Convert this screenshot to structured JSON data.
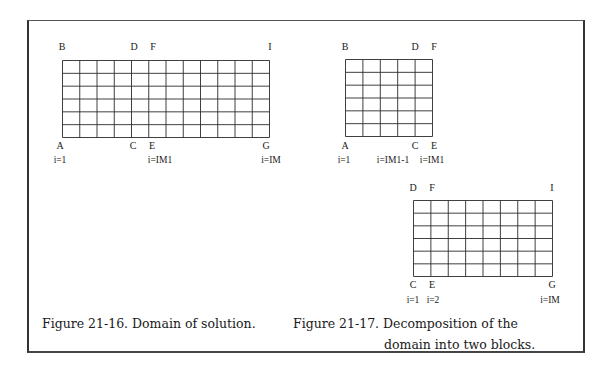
{
  "figures": [
    {
      "id": "fig-21-16",
      "caption": "Figure 21-16. Domain of solution.",
      "grid": {
        "x": 62,
        "y": 60,
        "width": 207,
        "height": 77,
        "columns": 12,
        "rows": 6
      },
      "corner_labels": [
        {
          "text": "B",
          "x": 62,
          "y": 42
        },
        {
          "text": "D",
          "x": 134,
          "y": 42
        },
        {
          "text": "F",
          "x": 153,
          "y": 42
        },
        {
          "text": "I",
          "x": 270,
          "y": 42
        },
        {
          "text": "A",
          "x": 60,
          "y": 141
        },
        {
          "text": "C",
          "x": 133,
          "y": 141
        },
        {
          "text": "E",
          "x": 152,
          "y": 141
        },
        {
          "text": "G",
          "x": 266,
          "y": 141
        }
      ],
      "index_labels": [
        {
          "text": "i=1",
          "x": 60,
          "y": 155
        },
        {
          "text": "i=IM1",
          "x": 160,
          "y": 155
        },
        {
          "text": "i=IM",
          "x": 271,
          "y": 155
        }
      ]
    },
    {
      "id": "fig-21-17",
      "caption_line1": "Figure 21-17. Decomposition of the",
      "caption_line2": "domain into two blocks.",
      "blocks": [
        {
          "grid": {
            "x": 345,
            "y": 59,
            "width": 87,
            "height": 77,
            "columns": 5,
            "rows": 6
          },
          "corner_labels": [
            {
              "text": "B",
              "x": 345,
              "y": 42
            },
            {
              "text": "D",
              "x": 415,
              "y": 42
            },
            {
              "text": "F",
              "x": 434,
              "y": 42
            },
            {
              "text": "A",
              "x": 345,
              "y": 141
            },
            {
              "text": "C",
              "x": 415,
              "y": 141
            },
            {
              "text": "E",
              "x": 434,
              "y": 141
            }
          ],
          "index_labels": [
            {
              "text": "i=1",
              "x": 344,
              "y": 155
            },
            {
              "text": "i=IM1-1",
              "x": 393,
              "y": 155
            },
            {
              "text": "i=IM1",
              "x": 432,
              "y": 155
            }
          ]
        },
        {
          "grid": {
            "x": 413,
            "y": 200,
            "width": 139,
            "height": 76,
            "columns": 8,
            "rows": 6
          },
          "corner_labels": [
            {
              "text": "D",
              "x": 413,
              "y": 183
            },
            {
              "text": "F",
              "x": 432,
              "y": 183
            },
            {
              "text": "I",
              "x": 552,
              "y": 183
            },
            {
              "text": "C",
              "x": 413,
              "y": 280
            },
            {
              "text": "E",
              "x": 432,
              "y": 280
            },
            {
              "text": "G",
              "x": 552,
              "y": 280
            }
          ],
          "index_labels": [
            {
              "text": "i=1",
              "x": 413,
              "y": 295
            },
            {
              "text": "i=2",
              "x": 433,
              "y": 295
            },
            {
              "text": "i=IM",
              "x": 550,
              "y": 295
            }
          ]
        }
      ]
    }
  ]
}
